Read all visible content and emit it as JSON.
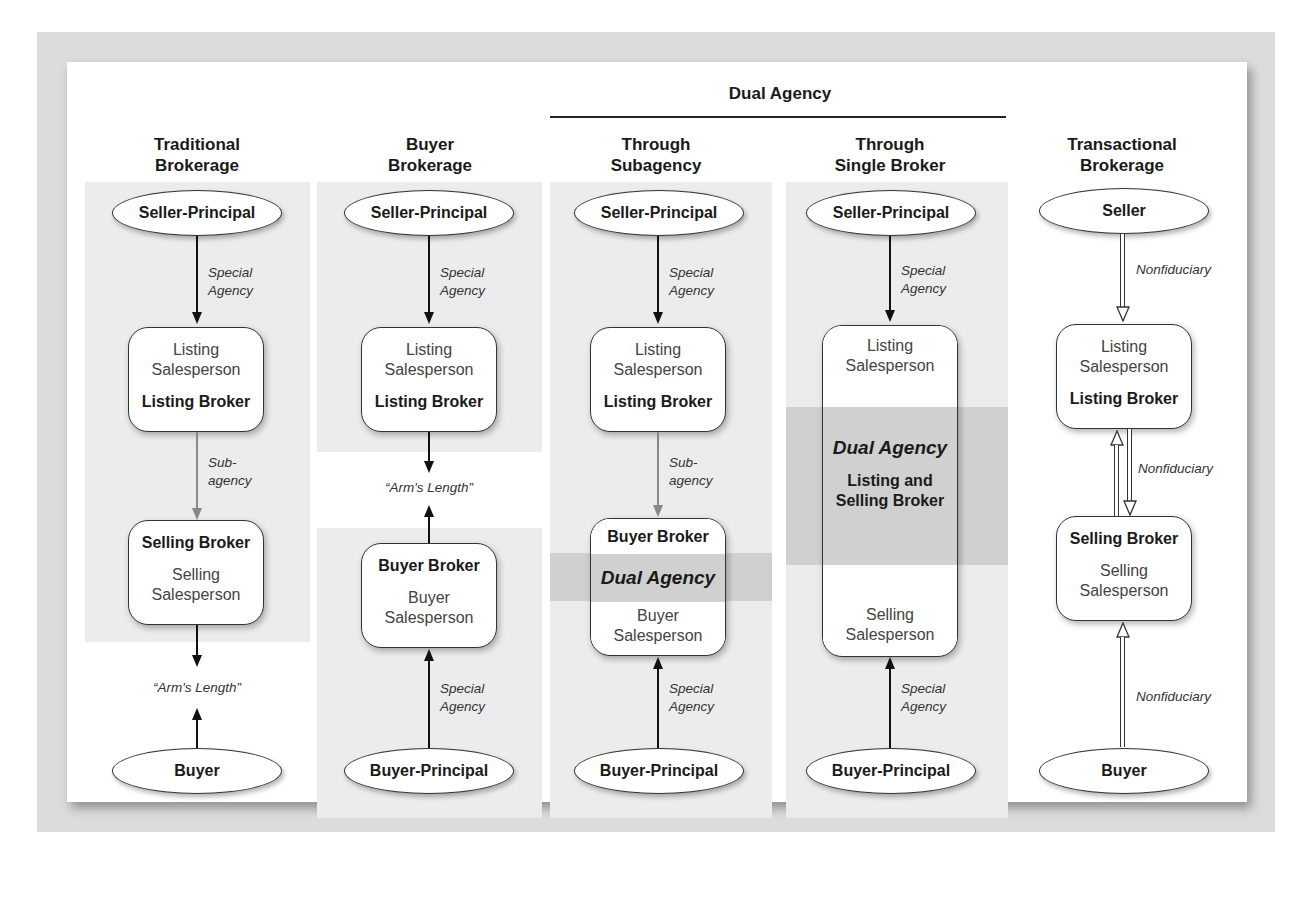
{
  "diagram": {
    "group_header": "Dual Agency",
    "columns": [
      {
        "id": "traditional",
        "title_lines": [
          "Traditional",
          "Brokerage"
        ],
        "top_node": "Seller-Principal",
        "top_link": [
          "Special",
          "Agency"
        ],
        "box1": {
          "light": [
            "Listing",
            "Salesperson"
          ],
          "bold": "Listing Broker"
        },
        "mid_link": [
          "Sub-",
          "agency"
        ],
        "box2": {
          "bold": "Selling Broker",
          "light": [
            "Selling",
            "Salesperson"
          ]
        },
        "relation": "“Arm's Length”",
        "bottom_node": "Buyer"
      },
      {
        "id": "buyer",
        "title_lines": [
          "Buyer",
          "Brokerage"
        ],
        "top_node": "Seller-Principal",
        "top_link": [
          "Special",
          "Agency"
        ],
        "box1": {
          "light": [
            "Listing",
            "Salesperson"
          ],
          "bold": "Listing Broker"
        },
        "relation": "“Arm's Length”",
        "box2": {
          "bold": "Buyer Broker",
          "light": [
            "Buyer",
            "Salesperson"
          ]
        },
        "bottom_link": [
          "Special",
          "Agency"
        ],
        "bottom_node": "Buyer-Principal"
      },
      {
        "id": "subagency",
        "title_lines": [
          "Through",
          "Subagency"
        ],
        "top_node": "Seller-Principal",
        "top_link": [
          "Special",
          "Agency"
        ],
        "box1": {
          "light": [
            "Listing",
            "Salesperson"
          ],
          "bold": "Listing Broker"
        },
        "mid_link": [
          "Sub-",
          "agency"
        ],
        "box2": {
          "bold": "Buyer Broker",
          "band": "Dual Agency",
          "light": [
            "Buyer",
            "Salesperson"
          ]
        },
        "bottom_link": [
          "Special",
          "Agency"
        ],
        "bottom_node": "Buyer-Principal"
      },
      {
        "id": "single",
        "title_lines": [
          "Through",
          "Single Broker"
        ],
        "top_node": "Seller-Principal",
        "top_link": [
          "Special",
          "Agency"
        ],
        "box": {
          "top_light": [
            "Listing",
            "Salesperson"
          ],
          "band": "Dual Agency",
          "band_bold": [
            "Listing and",
            "Selling Broker"
          ],
          "bottom_light": [
            "Selling",
            "Salesperson"
          ]
        },
        "bottom_link": [
          "Special",
          "Agency"
        ],
        "bottom_node": "Buyer-Principal"
      },
      {
        "id": "transactional",
        "title_lines": [
          "Transactional",
          "Brokerage"
        ],
        "top_node": "Seller",
        "top_link": "Nonfiduciary",
        "box1": {
          "light": [
            "Listing",
            "Salesperson"
          ],
          "bold": "Listing Broker"
        },
        "mid_link": "Nonfiduciary",
        "box2": {
          "bold": "Selling Broker",
          "light": [
            "Selling",
            "Salesperson"
          ]
        },
        "bottom_link": "Nonfiduciary",
        "bottom_node": "Buyer"
      }
    ]
  }
}
